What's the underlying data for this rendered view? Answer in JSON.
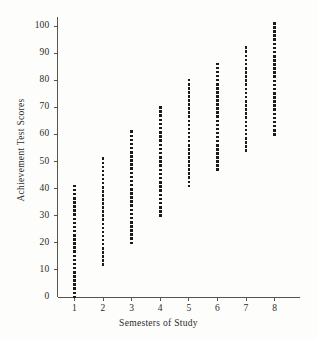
{
  "figure": {
    "background_color": "#fdfdfb",
    "ink_color": "#1b1b1b",
    "axis_color": "#55544f"
  },
  "chart_data": {
    "type": "scatter",
    "title": "",
    "xlabel": "Semesters of Study",
    "ylabel": "Achievement Test Scores",
    "xlim": [
      0,
      9
    ],
    "ylim": [
      0,
      105
    ],
    "grid": false,
    "legend": null,
    "x_tick_labels": [
      "1",
      "2",
      "3",
      "4",
      "5",
      "6",
      "7",
      "8"
    ],
    "x_ticks": [
      1,
      2,
      3,
      4,
      5,
      6,
      7,
      8
    ],
    "y_tick_labels": [
      "0",
      "10",
      "20",
      "30",
      "40",
      "50",
      "60",
      "70",
      "80",
      "90",
      "100"
    ],
    "y_ticks": [
      0,
      10,
      20,
      30,
      40,
      50,
      60,
      70,
      80,
      90,
      100
    ],
    "columns": [
      {
        "x": 1,
        "y_min": 0,
        "y_max": 41,
        "n_points": 28
      },
      {
        "x": 2,
        "y_min": 12,
        "y_max": 51,
        "n_points": 27
      },
      {
        "x": 3,
        "y_min": 20,
        "y_max": 61,
        "n_points": 28
      },
      {
        "x": 4,
        "y_min": 30,
        "y_max": 70,
        "n_points": 27
      },
      {
        "x": 5,
        "y_min": 41,
        "y_max": 80,
        "n_points": 27
      },
      {
        "x": 6,
        "y_min": 47,
        "y_max": 86,
        "n_points": 27
      },
      {
        "x": 7,
        "y_min": 54,
        "y_max": 92,
        "n_points": 26
      },
      {
        "x": 8,
        "y_min": 60,
        "y_max": 101,
        "n_points": 28
      }
    ]
  }
}
